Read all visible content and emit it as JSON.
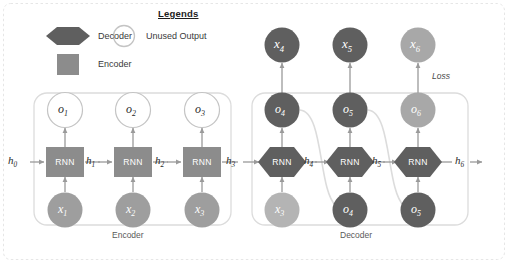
{
  "figure": {
    "title_visible": false,
    "background": "#ffffff"
  },
  "colors": {
    "encoder_fill": "#8c8c8c",
    "decoder_fill": "#5f5f5f",
    "input_circle_fill": "#9e9e9e",
    "output_circle_fill": "#5f5f5f",
    "faded_fill": "#b0b0b0",
    "unused_output_stroke": "#bdbdbd",
    "unused_output_fill": "#ffffff",
    "arrow": "#9a9a9a",
    "group_box": "#dcdcdc",
    "outer_dashed": "#e2e2e2",
    "feedback_curve": "#dadada",
    "text_dark": "#2a2a2a",
    "text_white": "#ffffff"
  },
  "legend": {
    "title": "Legends",
    "items": [
      {
        "key": "decoder",
        "label": "Decoder",
        "shape": "hexagon",
        "fill": "#5f5f5f"
      },
      {
        "key": "unused_output",
        "label": "Unused Output",
        "shape": "circle-outline",
        "fill": "#ffffff"
      },
      {
        "key": "encoder",
        "label": "Encoder",
        "shape": "square",
        "fill": "#8c8c8c"
      }
    ]
  },
  "groups": [
    {
      "key": "encoder",
      "caption": "Encoder"
    },
    {
      "key": "decoder",
      "caption": "Decoder"
    }
  ],
  "annotations": [
    {
      "key": "loss",
      "label": "Loss"
    }
  ],
  "encoder": {
    "cells": [
      {
        "id": "enc1",
        "cell_label": "RNN",
        "input": "x",
        "input_sub": "1",
        "output": "o",
        "output_sub": "1",
        "state_in": "h",
        "state_in_sub": "0",
        "state_out": "h",
        "state_out_sub": "1"
      },
      {
        "id": "enc2",
        "cell_label": "RNN",
        "input": "x",
        "input_sub": "2",
        "output": "o",
        "output_sub": "2",
        "state_in": "h",
        "state_in_sub": "1",
        "state_out": "h",
        "state_out_sub": "2"
      },
      {
        "id": "enc3",
        "cell_label": "RNN",
        "input": "x",
        "input_sub": "3",
        "output": "o",
        "output_sub": "3",
        "state_in": "h",
        "state_in_sub": "2",
        "state_out": "h",
        "state_out_sub": "3"
      }
    ]
  },
  "decoder": {
    "cells": [
      {
        "id": "dec1",
        "cell_label": "RNN",
        "input": "x",
        "input_sub": "3",
        "input_faded": true,
        "output": "o",
        "output_sub": "4",
        "target": "x",
        "target_sub": "4",
        "state_in": "h",
        "state_in_sub": "3",
        "state_out": "h",
        "state_out_sub": "4"
      },
      {
        "id": "dec2",
        "cell_label": "RNN",
        "input": "o",
        "input_sub": "4",
        "input_faded": false,
        "output": "o",
        "output_sub": "5",
        "target": "x",
        "target_sub": "5",
        "state_in": "h",
        "state_in_sub": "4",
        "state_out": "h",
        "state_out_sub": "5"
      },
      {
        "id": "dec3",
        "cell_label": "RNN",
        "input": "o",
        "input_sub": "5",
        "input_faded": false,
        "output": "o",
        "output_sub": "6",
        "output_faded": true,
        "target": "x",
        "target_sub": "6",
        "target_faded": true,
        "state_in": "h",
        "state_in_sub": "5",
        "state_out": "h",
        "state_out_sub": "6"
      }
    ]
  },
  "hidden_state_labels": [
    {
      "base": "h",
      "sub": "0"
    },
    {
      "base": "h",
      "sub": "1"
    },
    {
      "base": "h",
      "sub": "2"
    },
    {
      "base": "h",
      "sub": "3"
    },
    {
      "base": "h",
      "sub": "4"
    },
    {
      "base": "h",
      "sub": "5"
    },
    {
      "base": "h",
      "sub": "6"
    }
  ],
  "unused_outputs": [
    {
      "base": "o",
      "sub": "1"
    },
    {
      "base": "o",
      "sub": "2"
    },
    {
      "base": "o",
      "sub": "3"
    }
  ],
  "targets": [
    {
      "base": "x",
      "sub": "4"
    },
    {
      "base": "x",
      "sub": "5"
    },
    {
      "base": "x",
      "sub": "6"
    }
  ]
}
